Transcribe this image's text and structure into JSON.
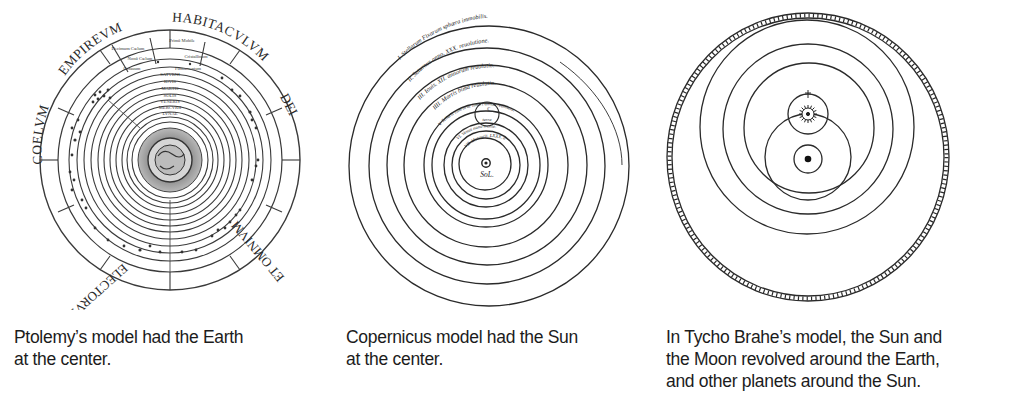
{
  "figures": [
    {
      "id": "ptolemy",
      "title": "Ptolemaic model",
      "outer_labels": [
        "COELVM",
        "EMPIREVM",
        "HABITACVLVM",
        "DEI",
        "ET OMNIVM",
        "ELECTORVM"
      ],
      "inner_labels": [
        "Primũ Mobile",
        "Decimum Cœlum",
        "Nonũ Cœlum",
        "Cristallinum",
        "Octauum",
        "Firmamentum",
        "SATVRNI",
        "IOVIS",
        "MARTIS",
        "SOLIS",
        "VENERIS",
        "MERCVRII",
        "LVNAE"
      ],
      "caption_lines": [
        "Ptolemy’s model had the Earth",
        "at the center."
      ]
    },
    {
      "id": "copernicus",
      "title": "Copernican model",
      "orbit_labels": [
        "I. Stellarum Fixarum sphæra immobilis.",
        "II. Saturnus anno. XXX. reuolutione.",
        "III. Iouis. XII. annorum reuolutio.",
        "IIII. Martis bima reuolutio.",
        "V. Telluris cum orbe lunari annua reuolutio.",
        "VI. Venus nono mense.",
        "VII. Mercurii. LXXX. dierum."
      ],
      "moon_label": "ℂ",
      "earth_label": "terra",
      "sun_label": "SoL.",
      "caption_lines": [
        "Copernicus model had the Sun",
        "at the center."
      ]
    },
    {
      "id": "tycho",
      "title": "Tychonic model",
      "caption_lines": [
        "In Tycho Brahe’s model, the Sun and",
        "the Moon revolved around the Earth,",
        "and other planets around the Sun."
      ]
    }
  ],
  "colors": {
    "ink": "#222222",
    "paper": "#ffffff",
    "caption_text": "#1c1c1c"
  }
}
